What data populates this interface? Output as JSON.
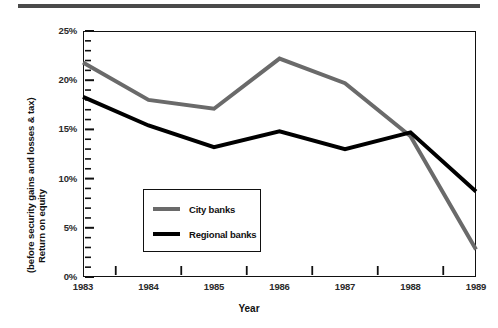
{
  "chart_data": {
    "type": "line",
    "title": "",
    "xlabel": "Year",
    "ylabel": "Return on equity (before security gains and losses & tax)",
    "ylabel_lines": [
      "Return on equity",
      "(before security gains and losses & tax)"
    ],
    "categories": [
      "1983",
      "1984",
      "1985",
      "1986",
      "1987",
      "1988",
      "1989"
    ],
    "x": [
      1983,
      1984,
      1985,
      1986,
      1987,
      1988,
      1989
    ],
    "ylim": [
      0,
      25
    ],
    "yticks": [
      0,
      5,
      10,
      15,
      20,
      25
    ],
    "ytick_labels": [
      "0%",
      "5%",
      "10%",
      "15%",
      "20%",
      "25%"
    ],
    "y_minor_tick_step": 1,
    "grid": false,
    "legend_position": "center-left-inside",
    "series": [
      {
        "name": "City banks",
        "color": "#6a6a6a",
        "values": [
          21.8,
          18.0,
          17.1,
          22.2,
          19.7,
          14.3,
          2.8
        ]
      },
      {
        "name": "Regional banks",
        "color": "#000000",
        "values": [
          18.3,
          15.4,
          13.2,
          14.8,
          13.0,
          14.7,
          8.7
        ]
      }
    ],
    "annotations": []
  },
  "legend": {
    "entries": [
      {
        "label": "City banks"
      },
      {
        "label": "Regional banks"
      }
    ]
  },
  "axes": {
    "x_title": "Year",
    "y_title_line1": "Return on equity",
    "y_title_line2": "(before security gains and losses & tax)"
  },
  "colors": {
    "city_banks": "#6a6a6a",
    "regional_banks": "#000000",
    "frame": "#111111",
    "top_rule": "#4a4a4a",
    "background": "#ffffff"
  }
}
